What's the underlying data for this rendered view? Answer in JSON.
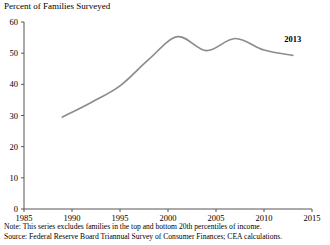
{
  "chart_data": {
    "type": "line",
    "title": "Percent of Families Surveyed",
    "xlabel": "",
    "ylabel": "",
    "xlim": [
      1985,
      2015
    ],
    "ylim": [
      0,
      60
    ],
    "xticks": [
      1985,
      1990,
      1995,
      2000,
      2005,
      2010,
      2015
    ],
    "yticks": [
      0,
      10,
      20,
      30,
      40,
      50,
      60
    ],
    "xtick_labels": [
      "1985",
      "1990",
      "1995",
      "2000",
      "2005",
      "2010",
      "2015"
    ],
    "ytick_labels": [
      "0",
      "10",
      "20",
      "30",
      "40",
      "50",
      "60"
    ],
    "grid": false,
    "legend": false,
    "line_color": "#8c8c8c",
    "series": [
      {
        "name": "Percent of Families Surveyed",
        "x": [
          1989,
          1992,
          1995,
          1998,
          2001,
          2004,
          2007,
          2010,
          2013
        ],
        "values": [
          29.5,
          34.2,
          39.5,
          48.0,
          55.3,
          50.8,
          54.7,
          51.0,
          49.3
        ]
      }
    ],
    "annotations": [
      {
        "text": "2013",
        "x": 2013,
        "y": 53.5
      }
    ]
  },
  "footnotes": {
    "note": "Note: This series excludes families in the top and bottom 20th percentiles of income.",
    "source": "Source: Federal Reserve Board Triannual Survey of Consumer Finances; CEA calculations."
  }
}
